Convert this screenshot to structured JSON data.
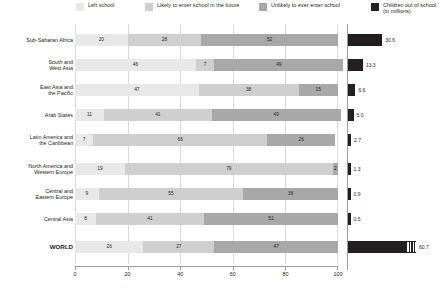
{
  "legend": {
    "items": [
      {
        "label": "Left school",
        "color": "#e8e8e8",
        "icon": "legend-swatch"
      },
      {
        "label": "Likely to enter school in the future",
        "color": "#cfcfcf",
        "icon": "legend-swatch"
      },
      {
        "label": "Unlikely to ever enter school",
        "color": "#a8a8a8",
        "icon": "legend-swatch"
      },
      {
        "label": "Children out of school (in millions)",
        "color": "#231f20",
        "icon": "legend-swatch"
      }
    ]
  },
  "chart_data": {
    "type": "bar",
    "orientation": "horizontal",
    "stacked": true,
    "title": "",
    "xlabel": "",
    "ylabel": "",
    "xlim": [
      0,
      100
    ],
    "xticks": [
      0,
      20,
      40,
      60,
      80,
      100
    ],
    "grid": true,
    "legend_position": "top",
    "categories": [
      "Sub-Saharan Africa",
      "South and West Asia",
      "East Asia and the Pacific",
      "Arab States",
      "Latin America and the Caribbean",
      "North America and Western Europe",
      "Central and Eastern Europe",
      "Central Asia",
      "WORLD"
    ],
    "series": [
      {
        "name": "Left school",
        "color": "#e8e8e8",
        "values": [
          20,
          46,
          47,
          11,
          7,
          19,
          9,
          8,
          26
        ]
      },
      {
        "name": "Likely to enter school in the future",
        "color": "#cfcfcf",
        "values": [
          28,
          7,
          38,
          41,
          66,
          79,
          55,
          41,
          27
        ]
      },
      {
        "name": "Unlikely to ever enter school",
        "color": "#a8a8a8",
        "values": [
          52,
          49,
          15,
          49,
          26,
          2,
          36,
          51,
          47
        ]
      }
    ],
    "secondary_panel": {
      "title": "Children out of school (in millions)",
      "color": "#231f20",
      "unit": "millions",
      "max": 60.7,
      "values": [
        30.6,
        13.3,
        6.6,
        5.0,
        2.7,
        1.3,
        0.9,
        0.5,
        60.7
      ],
      "value_labels": [
        "30.6",
        "13.3",
        "6.6",
        "5.0",
        "2.7",
        "1.3",
        "0.9",
        "0.5",
        "60.7"
      ],
      "hatched_rows": [
        8
      ]
    }
  },
  "axis": {
    "tick_labels": [
      "0",
      "20",
      "40",
      "60",
      "80",
      "100"
    ]
  },
  "rows": [
    {
      "label_lines": [
        "Sub-Saharan Africa"
      ],
      "bold": false
    },
    {
      "label_lines": [
        "South and",
        "West Asia"
      ],
      "bold": false
    },
    {
      "label_lines": [
        "East Asia and",
        "the Pacific"
      ],
      "bold": false
    },
    {
      "label_lines": [
        "Arab States"
      ],
      "bold": false
    },
    {
      "label_lines": [
        "Latin America and",
        "the Caribbean"
      ],
      "bold": false
    },
    {
      "label_lines": [
        "North America and",
        "Western Europe"
      ],
      "bold": false
    },
    {
      "label_lines": [
        "Central and",
        "Eastern Europe"
      ],
      "bold": false
    },
    {
      "label_lines": [
        "Central Asia"
      ],
      "bold": false
    },
    {
      "label_lines": [
        "WORLD"
      ],
      "bold": true
    }
  ]
}
